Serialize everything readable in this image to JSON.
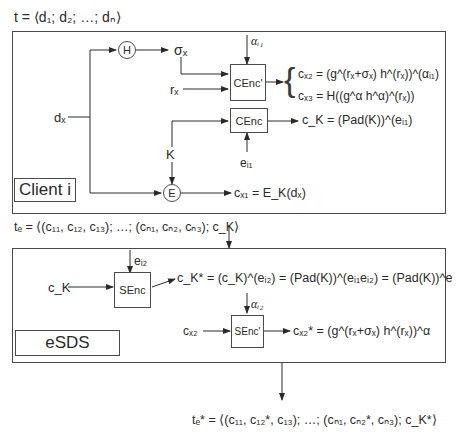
{
  "top_formula": "t = ⟨d₁; d₂; …; dₙ⟩",
  "client_panel": {
    "label": "Client i",
    "input": "dₓ",
    "hash_node": "H",
    "hash_output": "σₓ",
    "random_input": "rₓ",
    "key_label": "K",
    "encrypt_node": "E",
    "cenc_prime_block": "CEnc'",
    "cenc_prime_param": "αᵢ₁",
    "cenc_block": "CEnc",
    "cenc_param": "eᵢ₁",
    "outputs": {
      "cx2": "cₓ₂ = (g^(rₓ+σₓ) h^(rₓ))^(αᵢ₁)",
      "cx3": "cₓ₃ = H((g^α h^α)^(rₓ))",
      "cK": "c_K = (Pad(K))^(eᵢ₁)",
      "cx1": "cₓ₁ = E_K(dₓ)"
    }
  },
  "middle_formula": "tₑ = ⟨(c₁₁, c₁₂, c₁₃); …; (cₙ₁, cₙ₂, cₙ₃); c_K⟩",
  "esds_panel": {
    "label": "eSDS",
    "senc_block": "SEnc",
    "senc_param": "eᵢ₂",
    "senc_input": "c_K",
    "senc_output": "c_K* = (c_K)^(eᵢ₂) = (Pad(K))^(eᵢ₁eᵢ₂) = (Pad(K))^e",
    "senc_prime_block": "SEnc'",
    "senc_prime_param": "αᵢ₂",
    "senc_prime_input": "cₓ₂",
    "senc_prime_output": "cₓ₂* = (g^(rₓ+σₓ) h^(rₓ))^α"
  },
  "bottom_formula": "tₑ* = ⟨(c₁₁, c₁₂*, c₁₃); …; (cₙ₁, cₙ₂*, cₙ₃); c_K*⟩"
}
